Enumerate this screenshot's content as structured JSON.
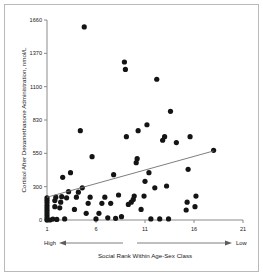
{
  "chart_data": {
    "type": "scatter",
    "title": "",
    "xlabel": "Social Rank Within Age-Sex Class",
    "ylabel": "Cortisol After Dexamethasone Administration, nmol/L",
    "xlim": [
      1,
      21
    ],
    "ylim": [
      0,
      1660
    ],
    "xticks": [
      1,
      6,
      11,
      16,
      21
    ],
    "yticks": [
      0,
      300,
      550,
      830,
      1100,
      1370,
      1660
    ],
    "xtick_labels": [
      "1",
      "6",
      "11",
      "16",
      "21"
    ],
    "ytick_labels": [
      "0",
      "300",
      "550",
      "830",
      "1100",
      "1370",
      "1660"
    ],
    "grid": false,
    "legend": null,
    "axis_endpoint_labels": {
      "left": "High",
      "right": "Low"
    },
    "marker": {
      "shape": "circle",
      "color": "#141414",
      "size": 2.6
    },
    "trendline": {
      "type": "linear",
      "color": "#6f6f6f",
      "x_start": 1.0,
      "y_start": 205,
      "x_end": 18.0,
      "y_end": 570
    },
    "points": [
      {
        "x": 1.0,
        "y": 0
      },
      {
        "x": 1.0,
        "y": 18
      },
      {
        "x": 1.0,
        "y": 40
      },
      {
        "x": 1.0,
        "y": 62
      },
      {
        "x": 1.0,
        "y": 85
      },
      {
        "x": 1.0,
        "y": 108
      },
      {
        "x": 1.0,
        "y": 130
      },
      {
        "x": 1.0,
        "y": 155
      },
      {
        "x": 1.0,
        "y": 178
      },
      {
        "x": 1.0,
        "y": 200
      },
      {
        "x": 1.3,
        "y": 0
      },
      {
        "x": 1.6,
        "y": 8
      },
      {
        "x": 1.8,
        "y": 120
      },
      {
        "x": 1.8,
        "y": 175
      },
      {
        "x": 1.9,
        "y": 205
      },
      {
        "x": 2.0,
        "y": 5
      },
      {
        "x": 2.3,
        "y": 110
      },
      {
        "x": 2.4,
        "y": 160
      },
      {
        "x": 2.5,
        "y": 210
      },
      {
        "x": 2.6,
        "y": 370
      },
      {
        "x": 2.8,
        "y": 10
      },
      {
        "x": 3.0,
        "y": 200
      },
      {
        "x": 3.2,
        "y": 255
      },
      {
        "x": 3.4,
        "y": 405
      },
      {
        "x": 3.8,
        "y": 95
      },
      {
        "x": 4.0,
        "y": 205
      },
      {
        "x": 4.2,
        "y": 250
      },
      {
        "x": 4.4,
        "y": 740
      },
      {
        "x": 4.6,
        "y": 290
      },
      {
        "x": 4.8,
        "y": 1600
      },
      {
        "x": 5.0,
        "y": 60
      },
      {
        "x": 5.2,
        "y": 150
      },
      {
        "x": 5.4,
        "y": 205
      },
      {
        "x": 5.6,
        "y": 525
      },
      {
        "x": 6.0,
        "y": 10
      },
      {
        "x": 6.3,
        "y": 60
      },
      {
        "x": 6.6,
        "y": 150
      },
      {
        "x": 6.9,
        "y": 205
      },
      {
        "x": 7.2,
        "y": 20
      },
      {
        "x": 7.5,
        "y": 150
      },
      {
        "x": 7.8,
        "y": 390
      },
      {
        "x": 8.0,
        "y": 15
      },
      {
        "x": 8.3,
        "y": 225
      },
      {
        "x": 8.6,
        "y": 30
      },
      {
        "x": 8.9,
        "y": 1300
      },
      {
        "x": 9.0,
        "y": 1240
      },
      {
        "x": 9.1,
        "y": 690
      },
      {
        "x": 9.3,
        "y": 140
      },
      {
        "x": 9.6,
        "y": 160
      },
      {
        "x": 9.8,
        "y": 185
      },
      {
        "x": 9.9,
        "y": 215
      },
      {
        "x": 10.1,
        "y": 480
      },
      {
        "x": 10.2,
        "y": 510
      },
      {
        "x": 10.3,
        "y": 740
      },
      {
        "x": 10.6,
        "y": 95
      },
      {
        "x": 10.9,
        "y": 215
      },
      {
        "x": 11.0,
        "y": 340
      },
      {
        "x": 11.2,
        "y": 790
      },
      {
        "x": 11.4,
        "y": 405
      },
      {
        "x": 11.6,
        "y": 10
      },
      {
        "x": 12.0,
        "y": 290
      },
      {
        "x": 12.2,
        "y": 1160
      },
      {
        "x": 12.5,
        "y": 10
      },
      {
        "x": 12.8,
        "y": 660
      },
      {
        "x": 13.0,
        "y": 690
      },
      {
        "x": 13.2,
        "y": 305
      },
      {
        "x": 13.4,
        "y": 10
      },
      {
        "x": 13.6,
        "y": 900
      },
      {
        "x": 14.2,
        "y": 640
      },
      {
        "x": 15.2,
        "y": 90
      },
      {
        "x": 15.3,
        "y": 160
      },
      {
        "x": 15.4,
        "y": 430
      },
      {
        "x": 15.6,
        "y": 690
      },
      {
        "x": 16.1,
        "y": 120
      },
      {
        "x": 16.2,
        "y": 215
      },
      {
        "x": 18.0,
        "y": 575
      }
    ]
  }
}
